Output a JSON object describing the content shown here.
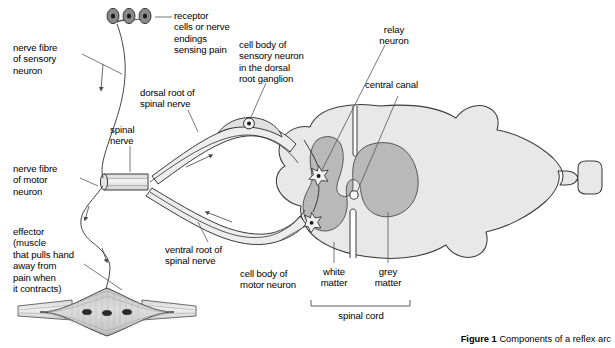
{
  "figure": {
    "caption_prefix": "Figure 1",
    "caption_text": " Components of a reflex arc"
  },
  "colors": {
    "outline": "#3b3b3b",
    "white_matter_fill": "#e8e8e8",
    "grey_matter_fill": "#b9b9b9",
    "ganglion_fill": "#e0e0e0",
    "nerve_fill": "#ededed",
    "muscle_fill": "#d4d4d4",
    "receptor_fill": "#8a8a8a",
    "background": "#ffffff",
    "text": "#000000",
    "leader_line": "#555555"
  },
  "labels": {
    "receptor_cells": "receptor\ncells or nerve\nendings\nsensing pain",
    "nerve_fibre_sensory": "nerve fibre\nof sensory\nneuron",
    "cell_body_sensory": "cell body of\nsensory neuron\nin the dorsal\nroot ganglion",
    "dorsal_root": "dorsal root of\nspinal nerve",
    "spinal_nerve": "spinal\nnerve",
    "relay_neuron": "relay\nneuron",
    "central_canal": "central canal",
    "nerve_fibre_motor": "nerve fibre\nof motor\nneuron",
    "effector": "effector\n(muscle\nthat pulls hand\naway from\npain when\nit contracts)",
    "ventral_root": "ventral root of\nspinal nerve",
    "cell_body_motor": "cell body of\nmotor neuron",
    "white_matter": "white\nmatter",
    "grey_matter": "grey\nmatter",
    "spinal_cord": "spinal cord"
  },
  "structures": {
    "receptor_cell_count": 3,
    "motor_end_plate_count": 3,
    "neuron_cell_body_count": 2,
    "arrow_count": 5
  }
}
